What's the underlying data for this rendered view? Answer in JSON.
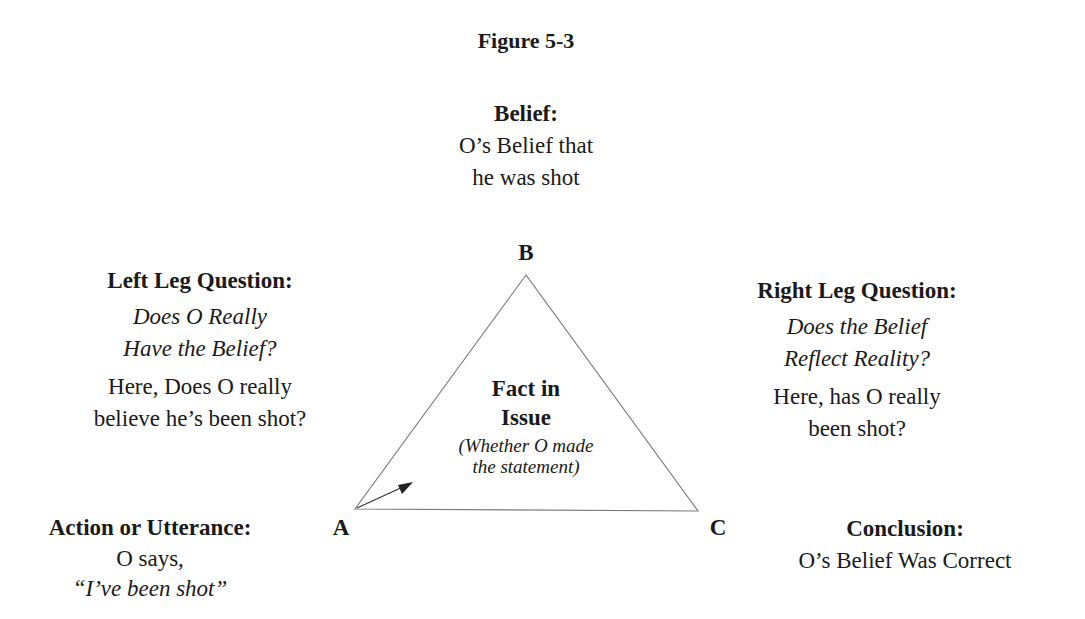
{
  "figure": {
    "title": "Figure 5-3"
  },
  "belief": {
    "heading": "Belief:",
    "lines": [
      "O’s Belief that",
      "he was shot"
    ]
  },
  "vertices": {
    "a": "A",
    "b": "B",
    "c": "C"
  },
  "left_leg": {
    "heading": "Left Leg Question:",
    "question_lines": [
      "Does O Really",
      "Have the Belief?"
    ],
    "detail_lines": [
      "Here, Does O really",
      "believe he’s been shot?"
    ]
  },
  "right_leg": {
    "heading": "Right Leg Question:",
    "question_lines": [
      "Does the Belief",
      "Reflect Reality?"
    ],
    "detail_lines": [
      "Here, has O really",
      "been shot?"
    ]
  },
  "center": {
    "heading_lines": [
      "Fact in",
      "Issue"
    ],
    "sub_lines": [
      "(Whether O made",
      "the statement)"
    ]
  },
  "action": {
    "heading": "Action or Utterance:",
    "lines": [
      "O says,",
      "“I’ve been shot”"
    ]
  },
  "conclusion": {
    "heading": "Conclusion:",
    "lines": [
      "O’s Belief Was Correct"
    ]
  },
  "colors": {
    "text": "#1a1a1a",
    "triangle_stroke": "#7a7a7a",
    "background": "#ffffff"
  }
}
